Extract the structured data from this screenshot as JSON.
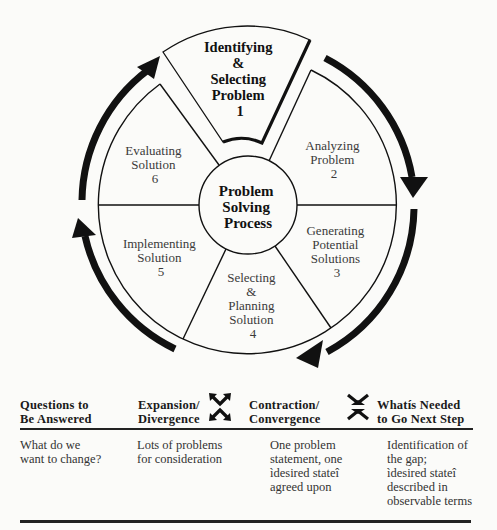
{
  "diagram": {
    "center_label": [
      "Problem",
      "Solving",
      "Process"
    ],
    "segments": [
      {
        "id": 1,
        "lines": [
          "Identifying",
          "&",
          "Selecting",
          "Problem",
          "1"
        ],
        "highlighted": true
      },
      {
        "id": 2,
        "lines": [
          "Analyzing",
          "Problem",
          "2"
        ]
      },
      {
        "id": 3,
        "lines": [
          "Generating",
          "Potential",
          "Solutions",
          "3"
        ]
      },
      {
        "id": 4,
        "lines": [
          "Selecting",
          "&",
          "Planning",
          "Solution",
          "4"
        ]
      },
      {
        "id": 5,
        "lines": [
          "Implementing",
          "Solution",
          "5"
        ]
      },
      {
        "id": 6,
        "lines": [
          "Evaluating",
          "Solution",
          "6"
        ]
      }
    ],
    "cycle_direction": "clockwise",
    "colors": {
      "line": "#111111",
      "background": "#fbfbf9",
      "text": "#3a3a3a"
    }
  },
  "table": {
    "headers": {
      "questions": [
        "Questions to",
        "Be Answered"
      ],
      "expansion": [
        "Expansion/",
        "Divergence"
      ],
      "contraction": [
        "Contraction/",
        "Convergence"
      ],
      "next_step": [
        "Whatís Needed",
        "to Go Next Step"
      ]
    },
    "icons": {
      "expansion": "expand-arrows-icon",
      "contraction": "contract-arrows-icon"
    },
    "row": {
      "questions": [
        "What do we",
        "want to change?"
      ],
      "expansion": [
        "Lots of problems",
        "for consideration"
      ],
      "contraction": [
        "One problem",
        "statement, one",
        "ìdesired stateî",
        "agreed upon"
      ],
      "next_step": [
        "Identification of",
        "the gap;",
        "ìdesired stateî",
        "described in",
        "observable terms"
      ]
    }
  }
}
